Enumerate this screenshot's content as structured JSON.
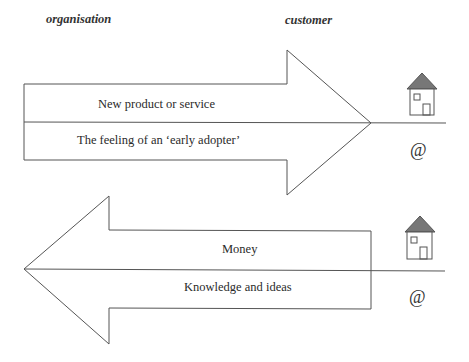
{
  "headers": {
    "left": "organisation",
    "right": "customer"
  },
  "top_arrow": {
    "direction": "right",
    "upper_label": "New product or service",
    "lower_label": "The feeling of an ‘early adopter’"
  },
  "bottom_arrow": {
    "direction": "left",
    "upper_label": "Money",
    "lower_label": "Knowledge and ideas"
  },
  "customer_icons": [
    {
      "icon": "house-icon",
      "at_symbol": "@"
    },
    {
      "icon": "house-icon",
      "at_symbol": "@"
    }
  ],
  "colors": {
    "stroke": "#555555",
    "text": "#2a2a2a"
  }
}
